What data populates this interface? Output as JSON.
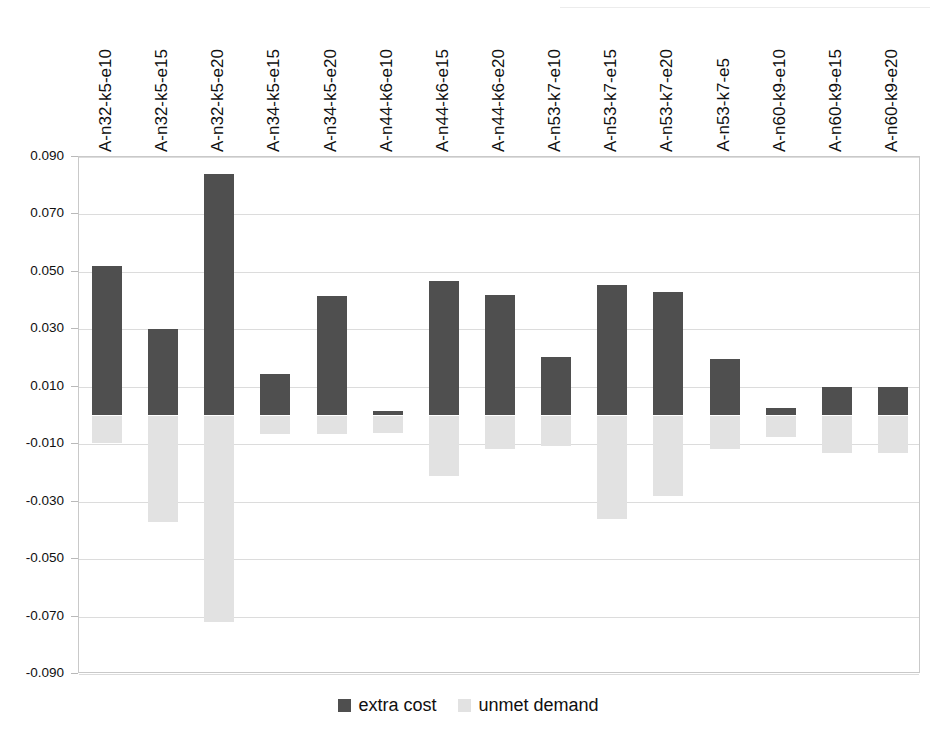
{
  "chart_data": {
    "type": "bar",
    "title": "",
    "subtitle": "",
    "xlabel": "",
    "ylabel": "",
    "ylim": [
      -0.09,
      0.09
    ],
    "ytick_labels": [
      "0.090",
      "0.070",
      "0.050",
      "0.030",
      "0.010",
      "-0.010",
      "-0.030",
      "-0.050",
      "-0.070",
      "-0.090"
    ],
    "ytick_values": [
      0.09,
      0.07,
      0.05,
      0.03,
      0.01,
      -0.01,
      -0.03,
      -0.05,
      -0.07,
      -0.09
    ],
    "grid": true,
    "legend_position": "bottom",
    "orientation": "vertical",
    "stacked": false,
    "categories": [
      "A-n32-k5-e10",
      "A-n32-k5-e15",
      "A-n32-k5-e20",
      "A-n34-k5-e15",
      "A-n34-k5-e20",
      "A-n44-k6-e10",
      "A-n44-k6-e15",
      "A-n44-k6-e20",
      "A-n53-k7-e10",
      "A-n53-k7-e15",
      "A-n53-k7-e20",
      "A-n53-k7-e5",
      "A-n60-k9-e10",
      "A-n60-k9-e15",
      "A-n60-k9-e20"
    ],
    "series": [
      {
        "name": "extra cost",
        "color": "#4f4f4f",
        "values": [
          0.052,
          0.03,
          0.084,
          0.0145,
          0.0415,
          0.0015,
          0.047,
          0.042,
          0.0205,
          0.0455,
          0.043,
          0.0195,
          0.0025,
          0.01,
          0.01
        ]
      },
      {
        "name": "unmet demand",
        "color": "#e2e2e2",
        "values": [
          -0.0095,
          -0.037,
          -0.072,
          -0.0065,
          -0.0065,
          -0.006,
          -0.021,
          -0.0115,
          -0.0105,
          -0.036,
          -0.028,
          -0.0115,
          -0.0075,
          -0.013,
          -0.013
        ]
      }
    ]
  },
  "legend": {
    "items": [
      {
        "label": "extra cost",
        "swatch_class": "cost"
      },
      {
        "label": "unmet demand",
        "swatch_class": "demand"
      }
    ]
  },
  "artifact": {
    "top_smudge": ""
  }
}
